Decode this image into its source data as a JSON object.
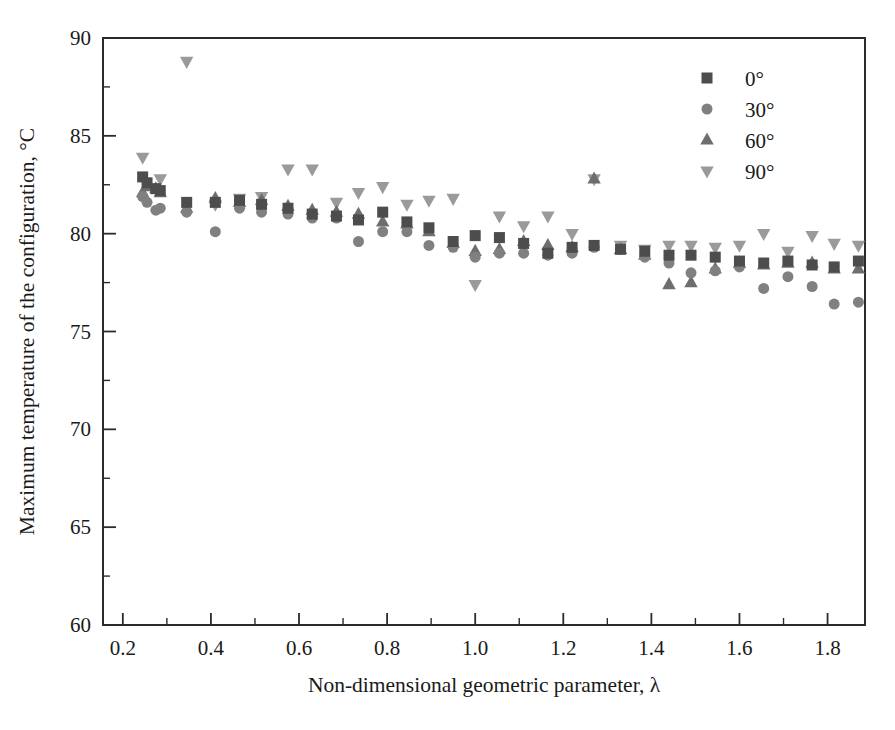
{
  "chart_data": {
    "type": "scatter",
    "title": "",
    "xlabel": "Non-dimensional geometric parameter, λ",
    "ylabel": "Maximum temperature of the configuration, °C",
    "xlim": [
      0.155,
      1.885
    ],
    "ylim": [
      60,
      90
    ],
    "xticks": [
      0.2,
      0.4,
      0.6,
      0.8,
      1.0,
      1.2,
      1.4,
      1.6,
      1.8
    ],
    "xticklabels": [
      "0.2",
      "0.4",
      "0.6",
      "0.8",
      "1.0",
      "1.2",
      "1.4",
      "1.6",
      "1.8"
    ],
    "xminor_step": 0.1,
    "yticks": [
      60,
      65,
      70,
      75,
      80,
      85,
      90
    ],
    "yticklabels": [
      "60",
      "65",
      "70",
      "75",
      "80",
      "85",
      "90"
    ],
    "yminor_step": 2.5,
    "grid": false,
    "legend_position": "top-right",
    "frame": "box",
    "series": [
      {
        "name": "0°",
        "marker": "square",
        "color": "#4d4d4d",
        "size": 11,
        "points": [
          [
            0.245,
            82.9
          ],
          [
            0.255,
            82.6
          ],
          [
            0.275,
            82.3
          ],
          [
            0.285,
            82.2
          ],
          [
            0.345,
            81.6
          ],
          [
            0.41,
            81.6
          ],
          [
            0.465,
            81.7
          ],
          [
            0.515,
            81.5
          ],
          [
            0.575,
            81.3
          ],
          [
            0.63,
            81.0
          ],
          [
            0.685,
            80.9
          ],
          [
            0.735,
            80.7
          ],
          [
            0.79,
            81.1
          ],
          [
            0.845,
            80.6
          ],
          [
            0.895,
            80.3
          ],
          [
            0.95,
            79.6
          ],
          [
            1.0,
            79.9
          ],
          [
            1.055,
            79.8
          ],
          [
            1.11,
            79.5
          ],
          [
            1.165,
            79.0
          ],
          [
            1.22,
            79.3
          ],
          [
            1.27,
            79.4
          ],
          [
            1.33,
            79.2
          ],
          [
            1.385,
            79.1
          ],
          [
            1.44,
            78.9
          ],
          [
            1.49,
            78.9
          ],
          [
            1.545,
            78.8
          ],
          [
            1.6,
            78.6
          ],
          [
            1.655,
            78.5
          ],
          [
            1.71,
            78.6
          ],
          [
            1.765,
            78.4
          ],
          [
            1.815,
            78.3
          ],
          [
            1.87,
            78.6
          ]
        ]
      },
      {
        "name": "30°",
        "marker": "circle",
        "color": "#808080",
        "size": 11,
        "points": [
          [
            0.245,
            81.9
          ],
          [
            0.255,
            81.6
          ],
          [
            0.275,
            81.2
          ],
          [
            0.285,
            81.3
          ],
          [
            0.345,
            81.1
          ],
          [
            0.41,
            80.1
          ],
          [
            0.465,
            81.3
          ],
          [
            0.515,
            81.1
          ],
          [
            0.575,
            81.0
          ],
          [
            0.63,
            80.8
          ],
          [
            0.685,
            80.8
          ],
          [
            0.735,
            79.6
          ],
          [
            0.79,
            80.1
          ],
          [
            0.845,
            80.1
          ],
          [
            0.895,
            79.4
          ],
          [
            0.95,
            79.3
          ],
          [
            1.0,
            78.8
          ],
          [
            1.055,
            79.0
          ],
          [
            1.11,
            79.0
          ],
          [
            1.165,
            78.9
          ],
          [
            1.22,
            79.0
          ],
          [
            1.27,
            79.3
          ],
          [
            1.33,
            79.2
          ],
          [
            1.385,
            78.8
          ],
          [
            1.44,
            78.5
          ],
          [
            1.49,
            78.0
          ],
          [
            1.545,
            78.1
          ],
          [
            1.6,
            78.3
          ],
          [
            1.655,
            77.2
          ],
          [
            1.71,
            77.8
          ],
          [
            1.765,
            77.3
          ],
          [
            1.815,
            76.4
          ],
          [
            1.87,
            76.5
          ]
        ]
      },
      {
        "name": "60°",
        "marker": "triangle-up",
        "color": "#6e6e6e",
        "size": 12,
        "points": [
          [
            0.245,
            82.1
          ],
          [
            0.255,
            82.4
          ],
          [
            0.275,
            82.3
          ],
          [
            0.285,
            82.1
          ],
          [
            0.345,
            81.3
          ],
          [
            0.41,
            81.8
          ],
          [
            0.465,
            81.6
          ],
          [
            0.515,
            81.7
          ],
          [
            0.575,
            81.4
          ],
          [
            0.63,
            81.2
          ],
          [
            0.685,
            81.1
          ],
          [
            0.735,
            81.0
          ],
          [
            0.79,
            80.6
          ],
          [
            0.845,
            80.5
          ],
          [
            0.895,
            80.1
          ],
          [
            0.95,
            79.5
          ],
          [
            1.0,
            79.1
          ],
          [
            1.055,
            79.2
          ],
          [
            1.11,
            79.6
          ],
          [
            1.165,
            79.4
          ],
          [
            1.22,
            79.3
          ],
          [
            1.27,
            82.8
          ],
          [
            1.33,
            79.2
          ],
          [
            1.385,
            78.9
          ],
          [
            1.44,
            77.4
          ],
          [
            1.49,
            77.5
          ],
          [
            1.545,
            78.2
          ],
          [
            1.6,
            78.5
          ],
          [
            1.655,
            78.4
          ],
          [
            1.71,
            78.5
          ],
          [
            1.765,
            78.5
          ],
          [
            1.815,
            78.2
          ],
          [
            1.87,
            78.2
          ]
        ]
      },
      {
        "name": "90°",
        "marker": "triangle-down",
        "color": "#9a9a9a",
        "size": 12,
        "points": [
          [
            0.245,
            83.9
          ],
          [
            0.285,
            82.8
          ],
          [
            0.345,
            88.8
          ],
          [
            0.41,
            81.5
          ],
          [
            0.465,
            81.8
          ],
          [
            0.515,
            81.9
          ],
          [
            0.575,
            83.3
          ],
          [
            0.63,
            83.3
          ],
          [
            0.685,
            81.6
          ],
          [
            0.735,
            82.1
          ],
          [
            0.79,
            82.4
          ],
          [
            0.845,
            81.5
          ],
          [
            0.895,
            81.7
          ],
          [
            0.95,
            81.8
          ],
          [
            1.0,
            77.4
          ],
          [
            1.055,
            80.9
          ],
          [
            1.11,
            80.4
          ],
          [
            1.165,
            80.9
          ],
          [
            1.22,
            80.0
          ],
          [
            1.27,
            82.8
          ],
          [
            1.33,
            79.4
          ],
          [
            1.385,
            79.2
          ],
          [
            1.44,
            79.4
          ],
          [
            1.49,
            79.4
          ],
          [
            1.545,
            79.3
          ],
          [
            1.6,
            79.4
          ],
          [
            1.655,
            80.0
          ],
          [
            1.71,
            79.1
          ],
          [
            1.765,
            79.9
          ],
          [
            1.815,
            79.5
          ],
          [
            1.87,
            79.4
          ]
        ]
      }
    ]
  },
  "legend": {
    "items": [
      {
        "label": "0°"
      },
      {
        "label": "30°"
      },
      {
        "label": "60°"
      },
      {
        "label": "90°"
      }
    ]
  }
}
